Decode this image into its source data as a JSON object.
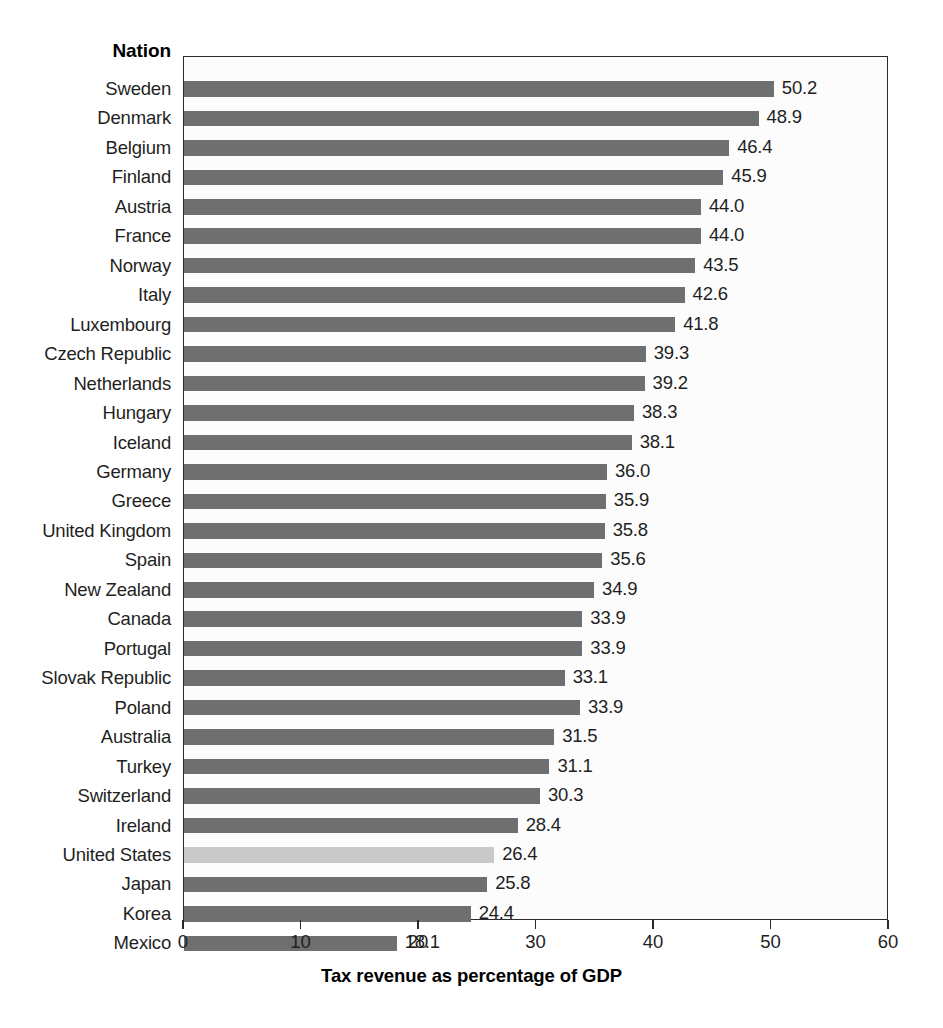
{
  "header": {
    "nation_label": "Nation"
  },
  "axis": {
    "title": "Tax revenue as percentage of GDP",
    "ticks": [
      "0",
      "10",
      "20",
      "30",
      "40",
      "50",
      "60"
    ]
  },
  "colors": {
    "bar": "#6f6f6f",
    "highlight_bar": "#c9c9c9",
    "frame": "#2a2a2a",
    "text": "#1f1f1f"
  },
  "chart_data": {
    "type": "bar",
    "orientation": "horizontal",
    "title": "",
    "xlabel": "Tax revenue as percentage of GDP",
    "ylabel": "Nation",
    "xlim": [
      0,
      60
    ],
    "xticks": [
      0,
      10,
      20,
      30,
      40,
      50,
      60
    ],
    "grid": false,
    "legend": "none",
    "highlight_category": "United States",
    "categories": [
      "Sweden",
      "Denmark",
      "Belgium",
      "Finland",
      "Austria",
      "France",
      "Norway",
      "Italy",
      "Luxembourg",
      "Czech Republic",
      "Netherlands",
      "Hungary",
      "Iceland",
      "Germany",
      "Greece",
      "United Kingdom",
      "Spain",
      "New Zealand",
      "Canada",
      "Portugal",
      "Slovak Republic",
      "Poland",
      "Australia",
      "Turkey",
      "Switzerland",
      "Ireland",
      "United States",
      "Japan",
      "Korea",
      "Mexico"
    ],
    "values": [
      50.2,
      48.9,
      46.4,
      45.9,
      44.0,
      44.0,
      43.5,
      42.6,
      41.8,
      39.3,
      39.2,
      38.3,
      38.1,
      36.0,
      35.9,
      35.8,
      35.6,
      34.9,
      33.9,
      33.9,
      33.1,
      33.9,
      31.5,
      31.1,
      30.3,
      28.4,
      26.4,
      25.8,
      24.4,
      18.1
    ],
    "bar_lengths": [
      50.2,
      48.9,
      46.4,
      45.9,
      44.0,
      44.0,
      43.5,
      42.6,
      41.8,
      39.3,
      39.2,
      38.3,
      38.1,
      36.0,
      35.9,
      35.8,
      35.6,
      34.9,
      33.9,
      33.9,
      32.4,
      33.7,
      31.5,
      31.1,
      30.3,
      28.4,
      26.4,
      25.8,
      24.4,
      18.1
    ],
    "value_labels": [
      "50.2",
      "48.9",
      "46.4",
      "45.9",
      "44.0",
      "44.0",
      "43.5",
      "42.6",
      "41.8",
      "39.3",
      "39.2",
      "38.3",
      "38.1",
      "36.0",
      "35.9",
      "35.8",
      "35.6",
      "34.9",
      "33.9",
      "33.9",
      "33.1",
      "33.9",
      "31.5",
      "31.1",
      "30.3",
      "28.4",
      "26.4",
      "25.8",
      "24.4",
      "18.1"
    ]
  }
}
